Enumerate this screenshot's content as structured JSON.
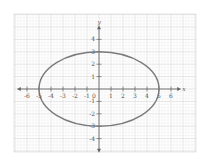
{
  "chart_data": {
    "type": "line",
    "title": "",
    "xlabel": "x",
    "ylabel": "y",
    "xlim": [
      -6.5,
      6.5
    ],
    "ylim": [
      -4.5,
      4.5
    ],
    "grid": true,
    "x_ticks": [
      -6,
      -5,
      -4,
      -3,
      -2,
      -1,
      1,
      2,
      3,
      4,
      5,
      6
    ],
    "x_tick_labels": [
      "-6",
      "-5",
      "-4",
      "-3",
      "-2",
      "-1",
      "1",
      "2",
      "3",
      "4",
      "5",
      "6"
    ],
    "y_ticks": [
      -4,
      -3,
      -2,
      -1,
      1,
      2,
      3,
      4
    ],
    "y_tick_labels": [
      "-4",
      "-3",
      "-2",
      "-1",
      "1",
      "2",
      "3",
      "4"
    ],
    "origin_label": "0",
    "series": [
      {
        "name": "ellipse",
        "shape": "ellipse",
        "center": [
          0,
          0
        ],
        "semi_axis_x": 5,
        "semi_axis_y": 3,
        "equation": "x^2/25 + y^2/9 = 1",
        "color": "#777777"
      }
    ]
  },
  "colors": {
    "grid_minor": "#ececec",
    "grid_major": "#d6d6d6",
    "axis": "#666666",
    "curve": "#7a7a7a",
    "background": "#ffffff"
  }
}
